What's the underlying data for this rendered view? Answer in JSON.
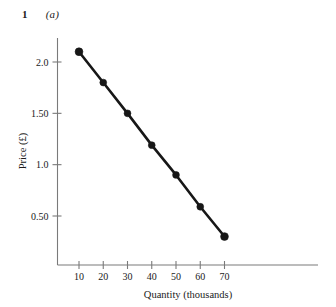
{
  "figure": {
    "number": "1",
    "part": "(a)"
  },
  "chart_data": {
    "type": "line",
    "title": "",
    "subtitle": "",
    "xlabel": "Quantity (thousands)",
    "ylabel": "Price (£)",
    "x": [
      10,
      20,
      30,
      40,
      50,
      60,
      70
    ],
    "values": [
      2.1,
      1.8,
      1.5,
      1.19,
      0.9,
      0.59,
      0.3
    ],
    "series": [
      {
        "name": "Demand",
        "x": [
          10,
          20,
          30,
          40,
          50,
          60,
          70
        ],
        "values": [
          2.1,
          1.8,
          1.5,
          1.19,
          0.9,
          0.59,
          0.3
        ]
      }
    ],
    "xticks": [
      10,
      20,
      30,
      40,
      50,
      60,
      70
    ],
    "xtick_labels": [
      "10",
      "20",
      "30",
      "40",
      "50",
      "60",
      "70"
    ],
    "yticks": [
      0.5,
      1.0,
      1.5,
      2.0
    ],
    "ytick_labels": [
      "0.50",
      "1.0",
      "1.50",
      "2.0"
    ],
    "xlim": [
      5,
      80
    ],
    "ylim": [
      0.06,
      2.32
    ],
    "grid": false,
    "legend": "none",
    "marker": "circle",
    "line_color": "#171717",
    "marker_color": "#171717",
    "axis_color": "#7a7a7a",
    "background_color": "#ffffff",
    "annotations": []
  }
}
